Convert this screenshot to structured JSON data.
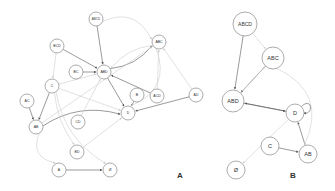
{
  "figure": {
    "panels": [
      {
        "id": "A",
        "label": "A",
        "label_pos": [
          180,
          175
        ],
        "nodes": [
          {
            "id": "ABCD",
            "label": "ABCD",
            "x": 96,
            "y": 19,
            "r": 7
          },
          {
            "id": "BCD",
            "label": "BCD",
            "x": 57,
            "y": 46,
            "r": 7
          },
          {
            "id": "BC",
            "label": "BC",
            "x": 76,
            "y": 72,
            "r": 7
          },
          {
            "id": "ABD",
            "label": "ABD",
            "x": 104,
            "y": 72,
            "r": 7
          },
          {
            "id": "ABC",
            "label": "ABC",
            "x": 159,
            "y": 42,
            "r": 7
          },
          {
            "id": "C",
            "label": "C",
            "x": 52,
            "y": 86,
            "r": 7
          },
          {
            "id": "B",
            "label": "B",
            "x": 137,
            "y": 95,
            "r": 7
          },
          {
            "id": "ACD",
            "label": "ACD",
            "x": 157,
            "y": 96,
            "r": 7
          },
          {
            "id": "AD",
            "label": "AD",
            "x": 196,
            "y": 95,
            "r": 7
          },
          {
            "id": "AC",
            "label": "AC",
            "x": 27,
            "y": 101,
            "r": 7
          },
          {
            "id": "AB",
            "label": "AB",
            "x": 36,
            "y": 127,
            "r": 7
          },
          {
            "id": "CD",
            "label": "CD",
            "x": 78,
            "y": 122,
            "r": 7
          },
          {
            "id": "D",
            "label": "D",
            "x": 128,
            "y": 113,
            "r": 7
          },
          {
            "id": "BD",
            "label": "BD",
            "x": 77,
            "y": 152,
            "r": 7
          },
          {
            "id": "A",
            "label": "A",
            "x": 59,
            "y": 170,
            "r": 7
          },
          {
            "id": "EMPTY",
            "label": "Ø",
            "x": 110,
            "y": 170,
            "r": 7
          }
        ],
        "edges": [
          {
            "from": "ABCD",
            "to": "ABD",
            "shade": "dark"
          },
          {
            "from": "BCD",
            "to": "ABD",
            "shade": "dark"
          },
          {
            "from": "BC",
            "to": "ABD",
            "shade": "dark"
          },
          {
            "from": "ACD",
            "to": "ABD",
            "shade": "dark"
          },
          {
            "from": "ABD",
            "to": "ABC",
            "shade": "dark",
            "curve": 10
          },
          {
            "from": "ABC",
            "to": "ABD",
            "shade": "light",
            "curve": 10
          },
          {
            "from": "ABD",
            "to": "D",
            "shade": "dark"
          },
          {
            "from": "C",
            "to": "ABD",
            "shade": "light"
          },
          {
            "from": "BCD",
            "to": "C",
            "shade": "light"
          },
          {
            "from": "ABCD",
            "to": "ABC",
            "shade": "light",
            "curve": -25
          },
          {
            "from": "ACD",
            "to": "ABC",
            "shade": "light"
          },
          {
            "from": "AD",
            "to": "ABC",
            "shade": "light"
          },
          {
            "from": "AD",
            "to": "D",
            "shade": "dark"
          },
          {
            "from": "B",
            "to": "D",
            "shade": "dark"
          },
          {
            "from": "AC",
            "to": "AB",
            "shade": "dark"
          },
          {
            "from": "C",
            "to": "AB",
            "shade": "dark"
          },
          {
            "from": "AB",
            "to": "D",
            "shade": "dark",
            "curve": -18
          },
          {
            "from": "AB",
            "to": "ABC",
            "shade": "light"
          },
          {
            "from": "CD",
            "to": "ABD",
            "shade": "light"
          },
          {
            "from": "BD",
            "to": "D",
            "shade": "light"
          },
          {
            "from": "C",
            "to": "D",
            "shade": "light"
          },
          {
            "from": "C",
            "to": "EMPTY",
            "shade": "light",
            "curve": 20
          },
          {
            "from": "C",
            "to": "BD",
            "shade": "light",
            "curve": 8
          },
          {
            "from": "AB",
            "to": "A",
            "shade": "light",
            "curve": 20
          },
          {
            "from": "A",
            "to": "EMPTY",
            "shade": "dark"
          },
          {
            "from": "ABC",
            "to": "D",
            "shade": "light",
            "curve": -30
          }
        ]
      },
      {
        "id": "B",
        "label": "B",
        "label_pos": [
          293,
          175
        ],
        "nodes": [
          {
            "id": "ABCD",
            "label": "ABCD",
            "x": 245,
            "y": 24,
            "r": 12
          },
          {
            "id": "ABC",
            "label": "ABC",
            "x": 273,
            "y": 58,
            "r": 11
          },
          {
            "id": "ABD",
            "label": "ABD",
            "x": 233,
            "y": 101,
            "r": 11
          },
          {
            "id": "D",
            "label": "D",
            "x": 295,
            "y": 113,
            "r": 9
          },
          {
            "id": "C",
            "label": "C",
            "x": 270,
            "y": 146,
            "r": 9
          },
          {
            "id": "AB",
            "label": "AB",
            "x": 308,
            "y": 154,
            "r": 9
          },
          {
            "id": "EMPTY",
            "label": "Ø",
            "x": 236,
            "y": 170,
            "r": 9
          }
        ],
        "edges": [
          {
            "from": "ABCD",
            "to": "ABD",
            "shade": "dark"
          },
          {
            "from": "ABC",
            "to": "ABD",
            "shade": "dark"
          },
          {
            "from": "ABD",
            "to": "D",
            "shade": "dark"
          },
          {
            "from": "D",
            "to": "ABD",
            "shade": "dark"
          },
          {
            "from": "AB",
            "to": "D",
            "shade": "dark"
          },
          {
            "from": "C",
            "to": "AB",
            "shade": "dark"
          },
          {
            "from": "D",
            "to": "EMPTY",
            "shade": "light"
          },
          {
            "from": "ABCD",
            "to": "ABC",
            "shade": "light"
          },
          {
            "from": "ABC",
            "to": "AB",
            "shade": "light",
            "curve": -40
          },
          {
            "from": "ABD",
            "to": "ABC",
            "shade": "light"
          }
        ],
        "self_loops": [
          "D"
        ]
      }
    ],
    "colors": {
      "node_stroke": "#888888",
      "node_fill": "#ffffff",
      "edge_dark": "#555555",
      "edge_light": "#cccccc",
      "label": "#333333"
    }
  }
}
